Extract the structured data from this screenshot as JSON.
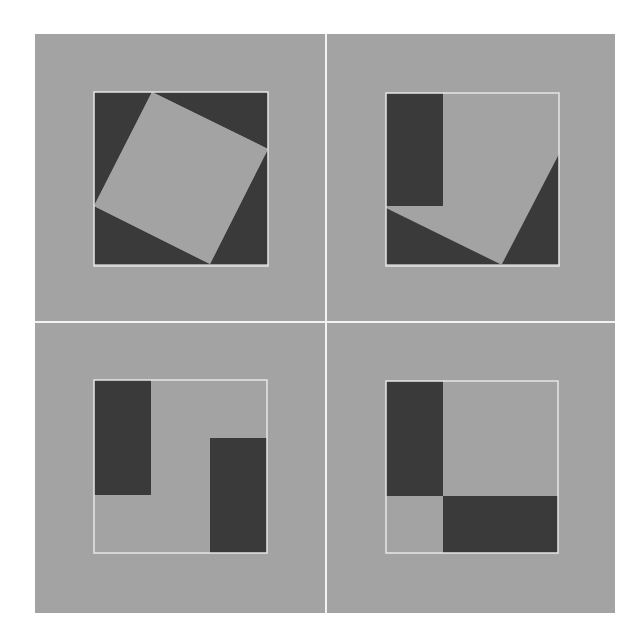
{
  "diagram": {
    "colors": {
      "page_bg": "#ffffff",
      "panel_bg": "#a3a3a3",
      "dark_fill": "#3a3a3a",
      "light_fill": "#a3a3a3",
      "outline": "#e6e6e6",
      "divider": "#f2f2f2"
    },
    "frame": {
      "x": 35,
      "y": 34,
      "w": 580,
      "h": 579
    },
    "dividers": {
      "x": 326,
      "y": 322
    },
    "panels": [
      {
        "id": "top-left",
        "square": {
          "x": 94,
          "y": 92,
          "size": 174
        },
        "dark_polys": [
          "94,92 152,92 94,206",
          "152,92 268,92 268,149",
          "268,149 268,264 210,264",
          "94,206 210,264 94,264"
        ],
        "light_polys": [
          "152,92 268,149 210,264 94,206"
        ]
      },
      {
        "id": "top-right",
        "square": {
          "x": 386,
          "y": 93,
          "size": 173
        },
        "dark_polys": [
          "386,93 443,93 443,206 386,206",
          "386,208 500,264 386,264",
          "559,154 559,264 502,264"
        ],
        "light_polys": []
      },
      {
        "id": "bottom-left",
        "square": {
          "x": 94,
          "y": 380,
          "size": 173
        },
        "dark_polys": [
          "94,380 151,380 151,495 94,495",
          "210,438 267,438 267,553 210,553"
        ],
        "light_polys": []
      },
      {
        "id": "bottom-right",
        "square": {
          "x": 386,
          "y": 381,
          "size": 172
        },
        "dark_polys": [
          "386,381 443,381 443,496 386,496",
          "443,496 558,496 558,553 443,553"
        ],
        "light_polys": []
      }
    ]
  }
}
